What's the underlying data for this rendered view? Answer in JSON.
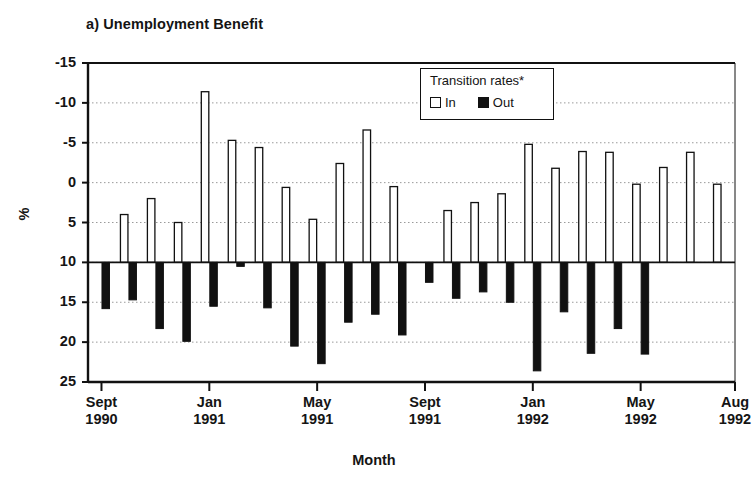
{
  "figure": {
    "panel_title": "a) Unemployment Benefit",
    "ylabel": "%",
    "xlabel": "Month"
  },
  "legend": {
    "title": "Transition rates*",
    "items": [
      {
        "label": "In",
        "swatch": "white-square-icon",
        "color": "#ffffff"
      },
      {
        "label": "Out",
        "swatch": "black-square-icon",
        "color": "#111111"
      }
    ]
  },
  "axes": {
    "y_ticks": [
      25,
      20,
      15,
      10,
      5,
      0,
      -5,
      -10,
      -15
    ],
    "y_tick_labels": [
      "25",
      "20",
      "15",
      "10",
      "5",
      "0",
      "-5",
      "-10",
      "-15"
    ],
    "x_tick_labels": [
      {
        "month": "Sept",
        "year": "1990"
      },
      {
        "month": "Jan",
        "year": "1991"
      },
      {
        "month": "May",
        "year": "1991"
      },
      {
        "month": "Sept",
        "year": "1991"
      },
      {
        "month": "Jan",
        "year": "1992"
      },
      {
        "month": "May",
        "year": "1992"
      },
      {
        "month": "Aug",
        "year": "1992"
      }
    ]
  },
  "chart_data": {
    "type": "bar",
    "title": "a) Unemployment Benefit",
    "xlabel": "Month",
    "ylabel": "%",
    "ylim": [
      -15,
      25
    ],
    "yticks": [
      -15,
      -10,
      -5,
      0,
      5,
      10,
      15,
      20,
      25
    ],
    "grid": "horizontal-dotted",
    "legend_position": "upper-center-right",
    "legend_title": "Transition rates*",
    "categories": [
      "Sept 1990",
      "Oct 1990",
      "Nov 1990",
      "Dec 1990",
      "Jan 1991",
      "Feb 1991",
      "Mar 1991",
      "Apr 1991",
      "May 1991",
      "Jun 1991",
      "Jul 1991",
      "Aug 1991",
      "Sept 1991",
      "Oct 1991",
      "Nov 1991",
      "Dec 1991",
      "Jan 1992",
      "Feb 1992",
      "Mar 1992",
      "Apr 1992",
      "May 1992",
      "Jun 1992",
      "Jul 1992",
      "Aug 1992"
    ],
    "series": [
      {
        "name": "In",
        "values": [
          0.0,
          6.0,
          8.0,
          5.0,
          21.4,
          15.3,
          14.4,
          9.4,
          5.4,
          12.4,
          16.6,
          9.5,
          0.0,
          6.5,
          7.5,
          8.6,
          14.8,
          11.8,
          13.9,
          13.8,
          9.8,
          11.9,
          13.8,
          9.8
        ]
      },
      {
        "name": "Out",
        "values": [
          -5.8,
          -4.7,
          -8.3,
          -9.9,
          -5.5,
          -0.5,
          -5.7,
          -10.5,
          -12.7,
          -7.5,
          -6.5,
          -9.1,
          -2.5,
          -4.5,
          -3.7,
          -5.0,
          -13.6,
          -6.2,
          -11.4,
          -8.3,
          -11.5,
          0.0,
          0.0,
          0.0
        ]
      }
    ],
    "annotations": [
      "* Transition rates"
    ]
  }
}
